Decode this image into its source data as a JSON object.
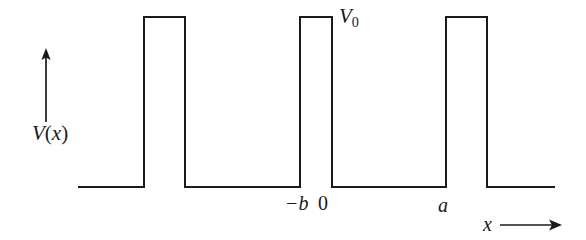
{
  "figure": {
    "width": 586,
    "height": 240,
    "background_color": "#ffffff",
    "stroke_color": "#1a1a1a",
    "text_color": "#1a1a1a"
  },
  "axes": {
    "y_axis": {
      "label_v": "V",
      "label_paren_open": "(",
      "label_var": "x",
      "label_paren_close": ")",
      "label_full": "V(x)",
      "arrow_direction": "up"
    },
    "x_axis": {
      "label": "x",
      "arrow_direction": "right"
    }
  },
  "annotations": {
    "barrier_height_symbol": "V",
    "barrier_height_subscript": "0",
    "barrier_height_full": "V0",
    "tick_minus_b": "−b",
    "tick_zero": "0",
    "tick_a": "a"
  },
  "chart_data": {
    "type": "line",
    "xlabel": "x",
    "ylabel": "V(x)",
    "grid": false,
    "legend": null,
    "series": [
      {
        "name": "V(x)",
        "comment": "Piecewise-constant potential traced left to right in figure pixel coordinates",
        "points_px": [
          [
            78,
            187
          ],
          [
            144,
            187
          ],
          [
            144,
            17
          ],
          [
            185,
            17
          ],
          [
            185,
            187
          ],
          [
            300,
            187
          ],
          [
            300,
            17
          ],
          [
            332,
            17
          ],
          [
            332,
            187
          ],
          [
            446,
            187
          ],
          [
            446,
            17
          ],
          [
            487,
            17
          ],
          [
            487,
            187
          ],
          [
            555,
            187
          ]
        ]
      }
    ],
    "levels": {
      "baseline_value": 0,
      "barrier_value_symbol": "V0"
    },
    "marked_x_values": [
      {
        "label": "−b",
        "x_px": 300
      },
      {
        "label": "0",
        "x_px": 332
      },
      {
        "label": "a",
        "x_px": 446
      }
    ],
    "barriers_px": [
      {
        "left": 144,
        "right": 185
      },
      {
        "left": 300,
        "right": 332
      },
      {
        "left": 446,
        "right": 487
      }
    ],
    "baseline_y_px": 187,
    "barrier_top_y_px": 17
  }
}
